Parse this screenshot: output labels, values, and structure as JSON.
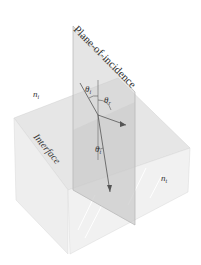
{
  "diagram": {
    "type": "optics-interface-3d",
    "labels": {
      "plane": "Plane-of-incidence",
      "interface": "Interface",
      "n_incident": "n",
      "n_incident_sub": "i",
      "n_transmitted": "n",
      "n_transmitted_sub": "t",
      "theta_i": "θ",
      "theta_i_sub": "i",
      "theta_r": "θ",
      "theta_r_sub": "r",
      "theta_t": "θ",
      "theta_t_sub": "t"
    },
    "colors": {
      "box_top": "#e8e8e8",
      "box_left": "#ededed",
      "box_right": "#f2f2f2",
      "plane": "#d6d6d6",
      "rays": "#555555"
    }
  }
}
